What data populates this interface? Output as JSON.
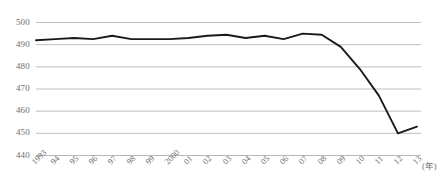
{
  "chart_data": {
    "type": "line",
    "title": "",
    "subtitle": "",
    "xlabel": "(年)",
    "ylabel": "",
    "ylim": [
      440,
      500
    ],
    "yticks": [
      500,
      490,
      480,
      470,
      460,
      450,
      440
    ],
    "grid": true,
    "legend": "none",
    "line_color": "#1a1a1a",
    "grid_color": "#b8b8b8",
    "tick_text_color": "#6d6d6d",
    "categories": [
      "1993",
      "94",
      "95",
      "96",
      "97",
      "98",
      "99",
      "2000",
      "01",
      "02",
      "03",
      "04",
      "05",
      "06",
      "07",
      "08",
      "09",
      "10",
      "11",
      "12",
      "13"
    ],
    "x": [
      1993,
      1994,
      1995,
      1996,
      1997,
      1998,
      1999,
      2000,
      2001,
      2002,
      2003,
      2004,
      2005,
      2006,
      2007,
      2008,
      2009,
      2010,
      2011,
      2012,
      2013
    ],
    "values": [
      492,
      492.5,
      493,
      492.5,
      494,
      492.5,
      492.5,
      492.5,
      493,
      494,
      494.5,
      493,
      494,
      492.5,
      495,
      494.5,
      489,
      479,
      467,
      450,
      453
    ]
  },
  "axis": {
    "unit_label": "(年)"
  }
}
